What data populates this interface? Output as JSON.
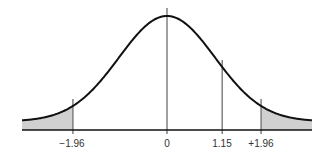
{
  "chart_data": {
    "type": "area",
    "title": "",
    "xlabel": "",
    "ylabel": "",
    "distribution": "standard normal",
    "x_range": [
      -3.02,
      3.02
    ],
    "grid": false,
    "legend": null,
    "markers": [
      {
        "z": -1.96,
        "label": "−1.96"
      },
      {
        "z": 0,
        "label": "0"
      },
      {
        "z": 1.15,
        "label": "1.15"
      },
      {
        "z": 1.96,
        "label": "+1.96"
      }
    ],
    "shaded_regions": [
      {
        "from": -3.02,
        "to": -1.96,
        "side": "left tail"
      },
      {
        "from": 1.96,
        "to": 3.02,
        "side": "right tail"
      }
    ],
    "tick_labels": [
      "−1.96",
      "0",
      "1.15",
      "+1.96"
    ]
  },
  "colors": {
    "curve": "#111111",
    "marker_lines": "#777777",
    "shade": "#d0d0d0",
    "baseline": "#111111"
  }
}
